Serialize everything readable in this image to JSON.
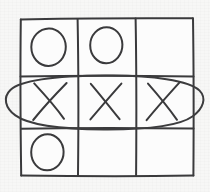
{
  "scene": {
    "title": "Tic Tac Toe Board",
    "medium": "hand-drawn sketch",
    "background_color": "#f7f7f6",
    "ink_color": "#3a3a3c",
    "board_fill_color": "#fcfcfc",
    "width": 210,
    "height": 192
  },
  "board": {
    "name": "tic-tac-toe-grid",
    "rows": 3,
    "columns": 3,
    "bounds": {
      "x": 20,
      "y": 18,
      "width": 174,
      "height": 158
    },
    "grid_lines": {
      "vertical_x": [
        78,
        136
      ],
      "horizontal_y": [
        76,
        128
      ]
    },
    "cells": [
      {
        "row": 0,
        "col": 0,
        "mark": "O",
        "label": "O",
        "cx": 48,
        "cy": 47,
        "rx": 17,
        "ry": 19
      },
      {
        "row": 0,
        "col": 1,
        "mark": "O",
        "label": "O",
        "cx": 106,
        "cy": 45,
        "rx": 16,
        "ry": 18
      },
      {
        "row": 0,
        "col": 2,
        "mark": "",
        "label": "",
        "cx": 165,
        "cy": 47,
        "rx": 0,
        "ry": 0
      },
      {
        "row": 1,
        "col": 0,
        "mark": "X",
        "label": "X",
        "cx": 50,
        "cy": 101,
        "rx": 18,
        "ry": 19
      },
      {
        "row": 1,
        "col": 1,
        "mark": "X",
        "label": "X",
        "cx": 106,
        "cy": 101,
        "rx": 17,
        "ry": 18
      },
      {
        "row": 1,
        "col": 2,
        "mark": "X",
        "label": "X",
        "cx": 164,
        "cy": 101,
        "rx": 18,
        "ry": 19
      },
      {
        "row": 2,
        "col": 0,
        "mark": "O",
        "label": "O",
        "cx": 47,
        "cy": 152,
        "rx": 16,
        "ry": 18
      },
      {
        "row": 2,
        "col": 1,
        "mark": "",
        "label": "",
        "cx": 106,
        "cy": 152,
        "rx": 0,
        "ry": 0
      },
      {
        "row": 2,
        "col": 2,
        "mark": "",
        "label": "",
        "cx": 165,
        "cy": 152,
        "rx": 0,
        "ry": 0
      }
    ]
  },
  "annotation": {
    "name": "winning-line-circle",
    "shape": "ellipse",
    "description": "hand-drawn ellipse circling the middle row",
    "winning_line": "middle row",
    "winning_mark": "X",
    "cx": 106,
    "cy": 101,
    "rx": 96,
    "ry": 26,
    "rotation_deg": -1.5,
    "stroke_color": "#3c3c3e"
  },
  "state": {
    "x_count": 3,
    "o_count": 3,
    "empty_count": 3,
    "winner": "X",
    "status_text": "X wins"
  }
}
